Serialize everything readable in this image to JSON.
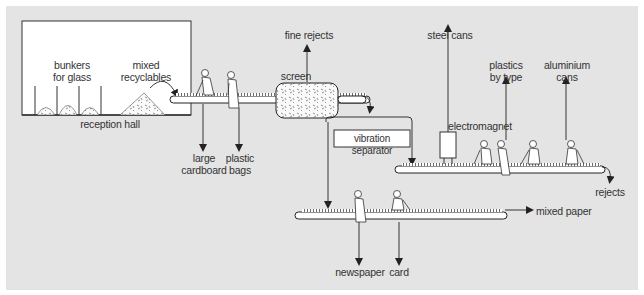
{
  "diagram": {
    "type": "process-flow"
  },
  "labels": {
    "bunkers": "bunkers\nfor glass",
    "mixed_recyclables": "mixed\nrecyclables",
    "reception_hall": "reception hall",
    "large_cardboard": "large\ncardboard",
    "plastic_bags": "plastic\nbags",
    "fine_rejects": "fine rejects",
    "screen": "screen",
    "vibration_separator": "vibration separator",
    "steel_cans": "steel cans",
    "electromagnet": "electromagnet",
    "plastics_by_type": "plastics\nby type",
    "aluminium_cans": "aluminium\ncans",
    "rejects": "rejects",
    "mixed_paper": "mixed paper",
    "newspaper": "newspaper",
    "card": "card"
  },
  "colors": {
    "background": "#e4e4e4",
    "line": "#333333",
    "box_fill": "#ffffff"
  },
  "nodes": [
    {
      "id": "reception-hall",
      "label": "reception hall"
    },
    {
      "id": "conveyor-1",
      "outputs": [
        "large cardboard",
        "plastic bags"
      ]
    },
    {
      "id": "screen",
      "outputs": [
        "fine rejects"
      ]
    },
    {
      "id": "vibration-separator"
    },
    {
      "id": "conveyor-2",
      "outputs": [
        "steel cans",
        "plastics by type",
        "aluminium cans",
        "rejects"
      ]
    },
    {
      "id": "conveyor-3",
      "outputs": [
        "newspaper",
        "card",
        "mixed paper"
      ]
    }
  ]
}
